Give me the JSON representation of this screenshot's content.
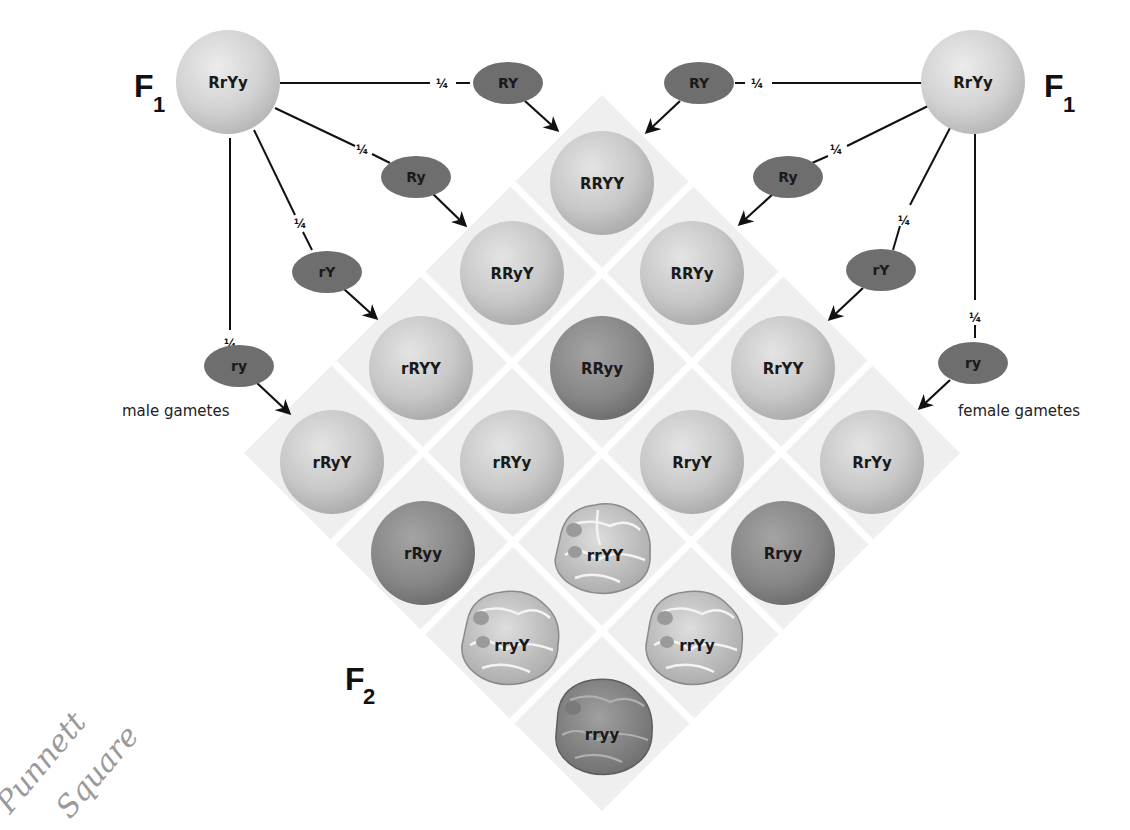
{
  "generations": {
    "f1_left": "F",
    "f1_left_sub": "1",
    "f1_right": "F",
    "f1_right_sub": "1",
    "f2": "F",
    "f2_sub": "2"
  },
  "parents": {
    "male": "RrYy",
    "female": "RrYy"
  },
  "fraction": "¼",
  "male_gametes": {
    "label": "male gametes",
    "items": [
      "RY",
      "Ry",
      "rY",
      "ry"
    ]
  },
  "female_gametes": {
    "label": "female gametes",
    "items": [
      "RY",
      "Ry",
      "rY",
      "ry"
    ]
  },
  "offspring": [
    {
      "genotype": "RRYY",
      "phenotype": "round-yellow"
    },
    {
      "genotype": "RRyY",
      "phenotype": "round-yellow"
    },
    {
      "genotype": "RRYy",
      "phenotype": "round-yellow"
    },
    {
      "genotype": "rRYY",
      "phenotype": "round-yellow"
    },
    {
      "genotype": "RRyy",
      "phenotype": "round-green"
    },
    {
      "genotype": "RrYY",
      "phenotype": "round-yellow"
    },
    {
      "genotype": "rRyY",
      "phenotype": "round-yellow"
    },
    {
      "genotype": "rRYy",
      "phenotype": "round-yellow"
    },
    {
      "genotype": "RryY",
      "phenotype": "round-yellow"
    },
    {
      "genotype": "RrYy",
      "phenotype": "round-yellow"
    },
    {
      "genotype": "rRyy",
      "phenotype": "round-green"
    },
    {
      "genotype": "rrYY",
      "phenotype": "wrinkled-yellow"
    },
    {
      "genotype": "Rryy",
      "phenotype": "round-green"
    },
    {
      "genotype": "rryY",
      "phenotype": "wrinkled-yellow"
    },
    {
      "genotype": "rrYy",
      "phenotype": "wrinkled-yellow"
    },
    {
      "genotype": "rryy",
      "phenotype": "wrinkled-green"
    }
  ],
  "handwriting": {
    "line1": "Punnett",
    "line2": "Square"
  },
  "colors": {
    "light_pea": "#c9c9c9",
    "dark_pea": "#8a8a8a",
    "gamete": "#6e6e6e",
    "grid_bg": "#efefef",
    "grid_line": "#ffffff"
  }
}
